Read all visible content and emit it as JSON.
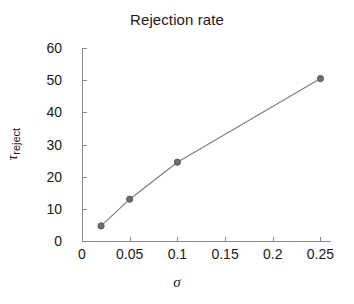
{
  "chart_data": {
    "type": "line",
    "title": "Rejection rate",
    "xlabel": "σ",
    "ylabel": "τ",
    "ylabel_sub": "reject",
    "x": [
      0.02,
      0.05,
      0.1,
      0.25
    ],
    "values": [
      4.7,
      13.0,
      24.5,
      50.5
    ],
    "series": [
      {
        "name": "rejection rate",
        "x": [
          0.02,
          0.05,
          0.1,
          0.25
        ],
        "values": [
          4.7,
          13.0,
          24.5,
          50.5
        ]
      }
    ],
    "xlim": [
      0,
      0.26
    ],
    "ylim": [
      0,
      60
    ],
    "xticks": [
      0,
      0.05,
      0.1,
      0.15,
      0.2,
      0.25
    ],
    "xtick_labels": [
      "0",
      "0.05",
      "0.1",
      "0.15",
      "0.2",
      "0.25"
    ],
    "yticks": [
      0,
      10,
      20,
      30,
      40,
      50,
      60
    ],
    "ytick_labels": [
      "0",
      "10",
      "20",
      "30",
      "40",
      "50",
      "60"
    ],
    "grid": false,
    "legend": null,
    "marker": "circle",
    "line_color": "#7f7f7f",
    "marker_face_color": "#6e6e6e",
    "marker_edge_color": "#5a5a5a",
    "axis_color": "#8a8a8a",
    "text_color": "#1a1a1a",
    "background": "#ffffff"
  }
}
